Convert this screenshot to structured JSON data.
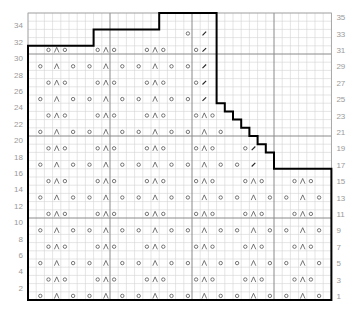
{
  "chart_data": {
    "type": "knitting-chart",
    "columns": 37,
    "rows": 35,
    "grid": {
      "cell_px": 8.2,
      "origin_x": 28,
      "origin_y": 13,
      "major_every": 10
    },
    "colors": {
      "minor_grid": "#d4d4d4",
      "major_grid": "#8a8a8a",
      "outline": "#000000",
      "symbol": "#555555",
      "label": "#9a9a9a"
    },
    "legend_symbols": {
      "o": "yarn over",
      "Λ": "centered double decrease",
      "/": "decrease"
    },
    "row_labels_left": [
      "2",
      "4",
      "6",
      "8",
      "10",
      "12",
      "14",
      "16",
      "18",
      "20",
      "22",
      "24",
      "26",
      "28",
      "30",
      "32",
      "34"
    ],
    "row_labels_right": [
      "1",
      "3",
      "5",
      "7",
      "9",
      "11",
      "13",
      "15",
      "17",
      "19",
      "21",
      "23",
      "25",
      "27",
      "29",
      "31",
      "33",
      "35"
    ],
    "outline": [
      [
        0,
        35
      ],
      [
        0,
        4
      ],
      [
        8,
        4
      ],
      [
        8,
        2
      ],
      [
        16,
        2
      ],
      [
        16,
        0
      ],
      [
        23,
        0
      ],
      [
        23,
        11
      ],
      [
        24,
        11
      ],
      [
        24,
        12
      ],
      [
        25,
        12
      ],
      [
        25,
        13
      ],
      [
        26,
        13
      ],
      [
        26,
        14
      ],
      [
        27,
        14
      ],
      [
        27,
        15
      ],
      [
        28,
        15
      ],
      [
        28,
        16
      ],
      [
        29,
        16
      ],
      [
        29,
        17
      ],
      [
        30,
        17
      ],
      [
        30,
        19
      ],
      [
        37,
        19
      ],
      [
        37,
        35
      ]
    ],
    "symbol_rows": [
      {
        "row": 1,
        "o": [
          1,
          5,
          7,
          11,
          13,
          17,
          19,
          23,
          25,
          29,
          31,
          35
        ],
        "Λ": [
          3,
          9,
          15,
          21,
          27,
          33
        ],
        "/": []
      },
      {
        "row": 3,
        "o": [
          2,
          4,
          8,
          10,
          14,
          16,
          20,
          22,
          26,
          28,
          32,
          34
        ],
        "Λ": [
          3,
          9,
          15,
          21,
          27,
          33
        ],
        "/": []
      },
      {
        "row": 5,
        "o": [
          1,
          5,
          7,
          11,
          13,
          17,
          19,
          23,
          25,
          29,
          31,
          35
        ],
        "Λ": [
          3,
          9,
          15,
          21,
          27,
          33
        ],
        "/": []
      },
      {
        "row": 7,
        "o": [
          2,
          4,
          8,
          10,
          14,
          16,
          20,
          22,
          26,
          28,
          32,
          34
        ],
        "Λ": [
          3,
          9,
          15,
          21,
          27,
          33
        ],
        "/": []
      },
      {
        "row": 9,
        "o": [
          1,
          5,
          7,
          11,
          13,
          17,
          19,
          23,
          25,
          29,
          31,
          35
        ],
        "Λ": [
          3,
          9,
          15,
          21,
          27,
          33
        ],
        "/": []
      },
      {
        "row": 11,
        "o": [
          2,
          4,
          8,
          10,
          14,
          16,
          20,
          22,
          26,
          28,
          32,
          34
        ],
        "Λ": [
          3,
          9,
          15,
          21,
          27,
          33
        ],
        "/": []
      },
      {
        "row": 13,
        "o": [
          1,
          5,
          7,
          11,
          13,
          17,
          19,
          23,
          25,
          29,
          31,
          35
        ],
        "Λ": [
          3,
          9,
          15,
          21,
          27,
          33
        ],
        "/": []
      },
      {
        "row": 15,
        "o": [
          2,
          4,
          8,
          10,
          14,
          16,
          20,
          22,
          26,
          28,
          32,
          34
        ],
        "Λ": [
          3,
          9,
          15,
          21,
          27,
          33
        ],
        "/": []
      },
      {
        "row": 17,
        "o": [
          1,
          5,
          7,
          11,
          13,
          17,
          19,
          23,
          25
        ],
        "Λ": [
          3,
          9,
          15,
          21
        ],
        "/": [
          27
        ]
      },
      {
        "row": 19,
        "o": [
          2,
          4,
          8,
          10,
          14,
          16,
          20,
          22,
          26
        ],
        "Λ": [
          3,
          9,
          15,
          21
        ],
        "/": [
          27
        ]
      },
      {
        "row": 21,
        "o": [
          1,
          5,
          7,
          11,
          13,
          17,
          19,
          23
        ],
        "Λ": [
          3,
          9,
          15,
          21
        ],
        "/": []
      },
      {
        "row": 23,
        "o": [
          2,
          4,
          8,
          10,
          14,
          16,
          20,
          22
        ],
        "Λ": [
          3,
          9,
          15,
          21
        ],
        "/": []
      },
      {
        "row": 25,
        "o": [
          1,
          5,
          7,
          11,
          13,
          17,
          19
        ],
        "Λ": [
          3,
          9,
          15
        ],
        "/": [
          21
        ]
      },
      {
        "row": 27,
        "o": [
          2,
          4,
          8,
          10,
          14,
          16,
          20
        ],
        "Λ": [
          3,
          9,
          15
        ],
        "/": [
          21
        ]
      },
      {
        "row": 29,
        "o": [
          1,
          5,
          7,
          11,
          13,
          17,
          19
        ],
        "Λ": [
          3,
          9,
          15
        ],
        "/": [
          21
        ]
      },
      {
        "row": 31,
        "o": [
          2,
          4,
          8,
          10,
          14,
          16,
          20
        ],
        "Λ": [
          3,
          9,
          15
        ],
        "/": [
          21
        ]
      },
      {
        "row": 33,
        "o": [
          19
        ],
        "Λ": [],
        "/": [
          21
        ]
      }
    ]
  }
}
